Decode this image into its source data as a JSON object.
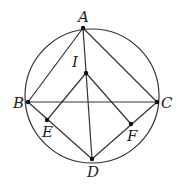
{
  "diagram": {
    "type": "geometry",
    "circle": {
      "cx": 92,
      "cy": 96,
      "r": 67
    },
    "points": {
      "A": {
        "label": "A",
        "x": 83,
        "y": 28
      },
      "I": {
        "label": "I",
        "x": 86,
        "y": 73
      },
      "B": {
        "label": "B",
        "x": 28,
        "y": 102
      },
      "C": {
        "label": "C",
        "x": 157,
        "y": 102
      },
      "E": {
        "label": "E",
        "x": 47,
        "y": 120
      },
      "F": {
        "label": "F",
        "x": 131,
        "y": 124
      },
      "D": {
        "label": "D",
        "x": 92,
        "y": 159
      }
    },
    "segments": [
      [
        "A",
        "B"
      ],
      [
        "A",
        "C"
      ],
      [
        "B",
        "C"
      ],
      [
        "A",
        "D"
      ],
      [
        "B",
        "D"
      ],
      [
        "C",
        "D"
      ],
      [
        "I",
        "E"
      ],
      [
        "I",
        "F"
      ]
    ]
  }
}
